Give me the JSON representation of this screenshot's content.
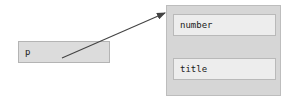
{
  "diagram": {
    "type": "object-reference-diagram",
    "background_color": "#ffffff",
    "variable": {
      "label": "p",
      "fill_color": "#dcdcdc",
      "border_color": "#b4b4b4"
    },
    "object": {
      "fill_color": "#d6d6d6",
      "border_color": "#bdbdbd",
      "fields": [
        {
          "label": "number",
          "fill_color": "#ededed",
          "border_color": "#b9b9b9"
        },
        {
          "label": "title",
          "fill_color": "#ededed",
          "border_color": "#b9b9b9"
        }
      ]
    },
    "arrow": {
      "name": "reference-arrow",
      "color": "#444444",
      "from_x": 62,
      "from_y": 58,
      "to_x": 165,
      "to_y": 13
    }
  }
}
